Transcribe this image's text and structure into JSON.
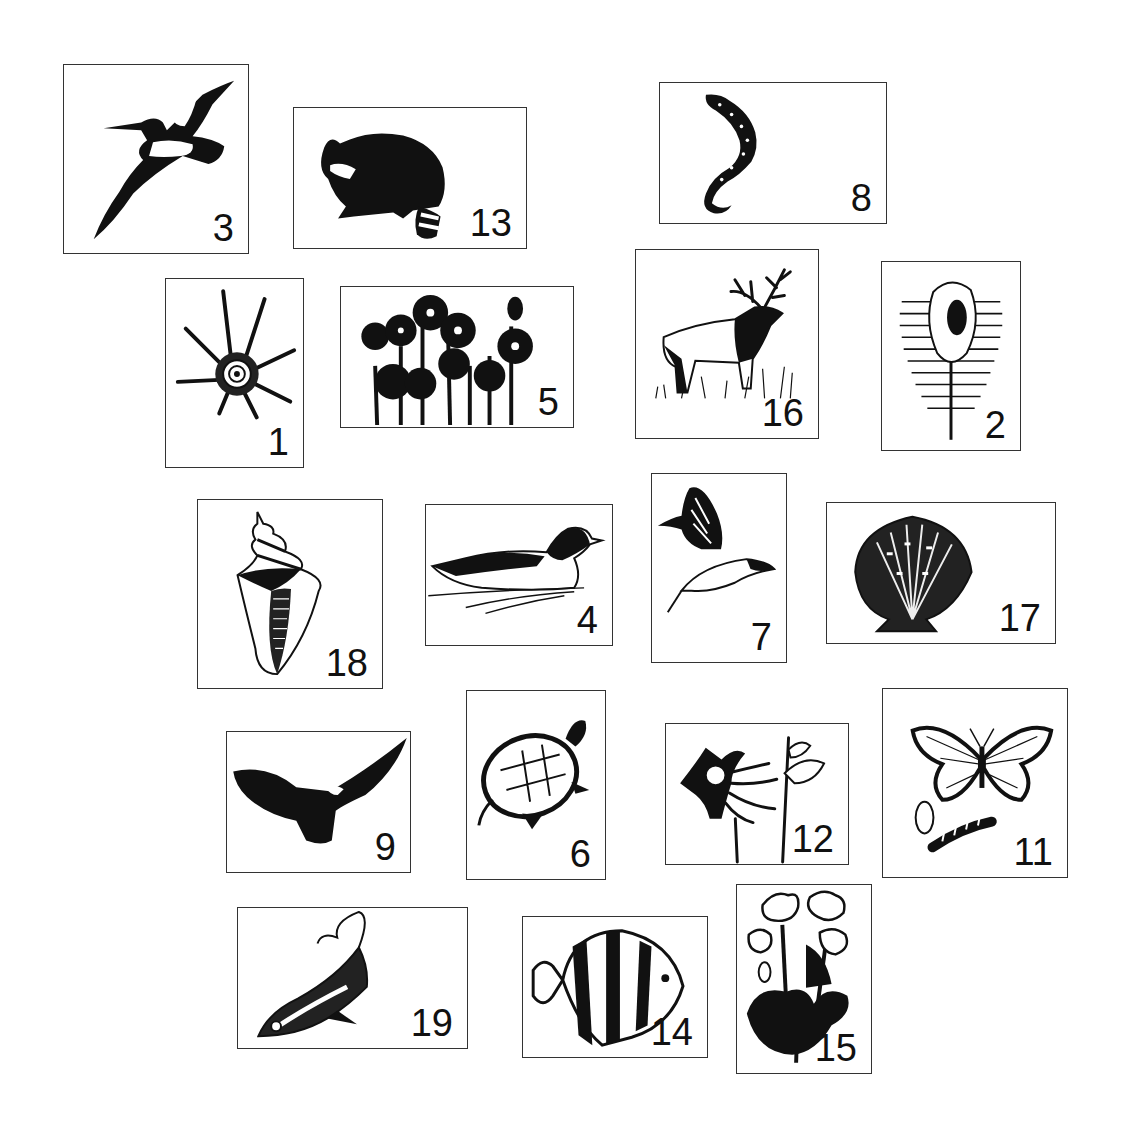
{
  "page": {
    "background": "#ffffff",
    "border_color": "#333333",
    "ink_color": "#111111"
  },
  "cards": [
    {
      "id": "c3",
      "number": "3",
      "subject": "pelican",
      "icon": "pelican-icon",
      "box": [
        63,
        64,
        186,
        190
      ]
    },
    {
      "id": "c13",
      "number": "13",
      "subject": "raccoon",
      "icon": "raccoon-icon",
      "box": [
        293,
        107,
        234,
        142
      ]
    },
    {
      "id": "c8",
      "number": "8",
      "subject": "salamander",
      "icon": "salamander-icon",
      "box": [
        659,
        82,
        228,
        142
      ]
    },
    {
      "id": "c1",
      "number": "1",
      "subject": "spiny sea shell",
      "icon": "spiny-shell-icon",
      "box": [
        165,
        278,
        139,
        190
      ]
    },
    {
      "id": "c5",
      "number": "5",
      "subject": "hepatica flowers",
      "icon": "flowers-icon",
      "box": [
        340,
        286,
        234,
        142
      ]
    },
    {
      "id": "c16",
      "number": "16",
      "subject": "elk",
      "icon": "elk-icon",
      "box": [
        635,
        249,
        184,
        190
      ]
    },
    {
      "id": "c2",
      "number": "2",
      "subject": "venus comb murex",
      "icon": "murex-shell-icon",
      "box": [
        881,
        261,
        140,
        190
      ]
    },
    {
      "id": "c18",
      "number": "18",
      "subject": "whelk shell",
      "icon": "whelk-shell-icon",
      "box": [
        197,
        499,
        186,
        190
      ]
    },
    {
      "id": "c4",
      "number": "4",
      "subject": "merganser duck",
      "icon": "duck-icon",
      "box": [
        425,
        504,
        188,
        142
      ]
    },
    {
      "id": "c7",
      "number": "7",
      "subject": "swallowtail butterfly",
      "icon": "swallowtail-icon",
      "box": [
        651,
        473,
        136,
        190
      ]
    },
    {
      "id": "c17",
      "number": "17",
      "subject": "scallop shell",
      "icon": "scallop-shell-icon",
      "box": [
        826,
        502,
        230,
        142
      ]
    },
    {
      "id": "c9",
      "number": "9",
      "subject": "bald eagle",
      "icon": "eagle-icon",
      "box": [
        226,
        731,
        185,
        142
      ]
    },
    {
      "id": "c6",
      "number": "6",
      "subject": "painted turtle",
      "icon": "turtle-icon",
      "box": [
        466,
        690,
        140,
        190
      ]
    },
    {
      "id": "c12",
      "number": "12",
      "subject": "columbine flower",
      "icon": "columbine-icon",
      "box": [
        665,
        723,
        184,
        142
      ]
    },
    {
      "id": "c11",
      "number": "11",
      "subject": "monarch butterfly life cycle",
      "icon": "monarch-icon",
      "box": [
        882,
        688,
        186,
        190
      ]
    },
    {
      "id": "c19",
      "number": "19",
      "subject": "deep sea fish",
      "icon": "fish-icon",
      "box": [
        237,
        907,
        231,
        142
      ]
    },
    {
      "id": "c14",
      "number": "14",
      "subject": "angelfish",
      "icon": "angelfish-icon",
      "box": [
        522,
        916,
        186,
        142
      ]
    },
    {
      "id": "c15",
      "number": "15",
      "subject": "violet plant",
      "icon": "violet-plant-icon",
      "box": [
        736,
        884,
        136,
        190
      ]
    }
  ]
}
